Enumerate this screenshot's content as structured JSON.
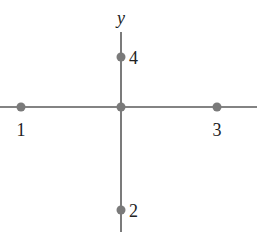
{
  "diagram": {
    "axis_label_y": "y",
    "colors": {
      "line": "#5a5a5a",
      "point": "#7a7a7a",
      "text": "#222222"
    },
    "points": [
      {
        "label": "1",
        "x": 21,
        "y": 107
      },
      {
        "label": "2",
        "x": 121,
        "y": 210
      },
      {
        "label": "3",
        "x": 217,
        "y": 107
      },
      {
        "label": "4",
        "x": 121,
        "y": 57
      }
    ],
    "origin": {
      "x": 121,
      "y": 107
    }
  }
}
